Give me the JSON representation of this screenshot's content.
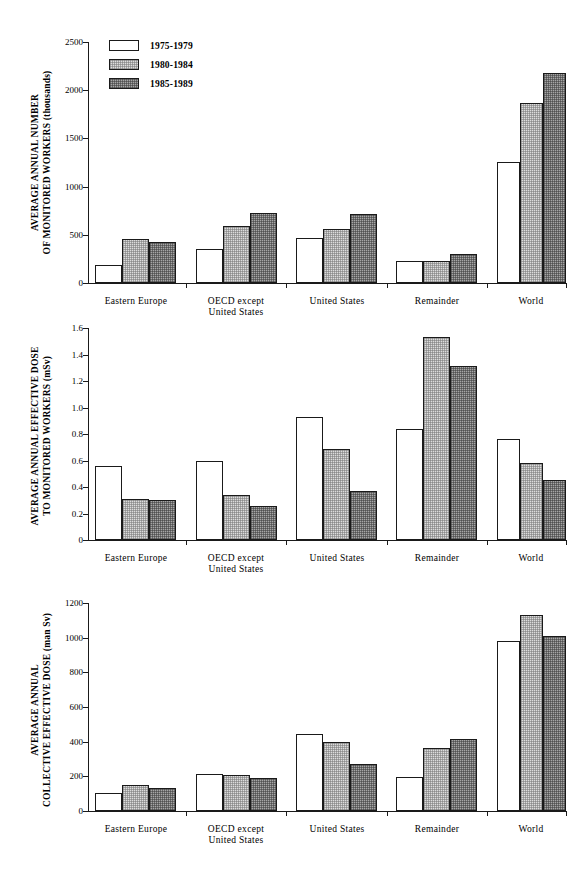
{
  "legend": {
    "position": "top-left-inside-first-panel",
    "entries": [
      {
        "label": "1975-1979",
        "fill": "#ffffff"
      },
      {
        "label": "1980-1984",
        "fill": "#dcdcdc"
      },
      {
        "label": "1985-1989",
        "fill": "#a6a6a6"
      }
    ]
  },
  "categories": [
    "Eastern  Europe",
    "OECD  except\nUnited  States",
    "United  States",
    "Remainder",
    "World"
  ],
  "chart_data": [
    {
      "type": "bar",
      "title": "",
      "ylabel": "AVERAGE  ANNUAL  NUMBER OF MONITORED WORKERS  (thousands)",
      "ylabel_line1": "AVERAGE  ANNUAL  NUMBER",
      "ylabel_line2": "OF MONITORED WORKERS  (thousands)",
      "xlabel": "",
      "ylim": [
        0,
        2500
      ],
      "yticks": [
        0,
        500,
        1000,
        1500,
        2000,
        2500
      ],
      "ytick_labels": [
        "0",
        "500",
        "1000",
        "1500",
        "2000",
        "2500"
      ],
      "grid": false,
      "legend": "top-left",
      "categories": [
        "Eastern  Europe",
        "OECD  except United  States",
        "United  States",
        "Remainder",
        "World"
      ],
      "series": [
        {
          "name": "1975-1979",
          "values": [
            190,
            355,
            470,
            225,
            1255
          ]
        },
        {
          "name": "1980-1984",
          "values": [
            455,
            595,
            565,
            225,
            1870
          ]
        },
        {
          "name": "1985-1989",
          "values": [
            425,
            725,
            720,
            305,
            2180
          ]
        }
      ]
    },
    {
      "type": "bar",
      "title": "",
      "ylabel": "AVERAGE  ANNUAL  EFFECTIVE DOSE TO MONITORED WORKERS  (mSv)",
      "ylabel_line1": "AVERAGE  ANNUAL  EFFECTIVE DOSE",
      "ylabel_line2": "TO MONITORED WORKERS  (mSv)",
      "xlabel": "",
      "ylim": [
        0,
        1.6
      ],
      "yticks": [
        0,
        0.2,
        0.4,
        0.6,
        0.8,
        1.0,
        1.2,
        1.4,
        1.6
      ],
      "ytick_labels": [
        "0",
        "0.2",
        "0.4",
        "0.6",
        "0.8",
        "1.0",
        "1.2",
        "1.4",
        "1.6"
      ],
      "grid": false,
      "legend": "none",
      "categories": [
        "Eastern  Europe",
        "OECD  except United  States",
        "United  States",
        "Remainder",
        "World"
      ],
      "series": [
        {
          "name": "1975-1979",
          "values": [
            0.56,
            0.6,
            0.93,
            0.84,
            0.76
          ]
        },
        {
          "name": "1980-1984",
          "values": [
            0.31,
            0.34,
            0.69,
            1.53,
            0.58
          ]
        },
        {
          "name": "1985-1989",
          "values": [
            0.3,
            0.26,
            0.37,
            1.31,
            0.45
          ]
        }
      ]
    },
    {
      "type": "bar",
      "title": "",
      "ylabel": "AVERAGE  ANNUAL COLLECTIVE EFFECTIVE DOSE  (man Sv)",
      "ylabel_line1": "AVERAGE  ANNUAL",
      "ylabel_line2": "COLLECTIVE EFFECTIVE DOSE  (man Sv)",
      "xlabel": "",
      "ylim": [
        0,
        1200
      ],
      "yticks": [
        0,
        200,
        400,
        600,
        800,
        1000,
        1200
      ],
      "ytick_labels": [
        "0",
        "200",
        "400",
        "600",
        "800",
        "1000",
        "1200"
      ],
      "grid": false,
      "legend": "none",
      "categories": [
        "Eastern  Europe",
        "OECD  except United  States",
        "United  States",
        "Remainder",
        "World"
      ],
      "series": [
        {
          "name": "1975-1979",
          "values": [
            105,
            215,
            445,
            195,
            980
          ]
        },
        {
          "name": "1980-1984",
          "values": [
            150,
            205,
            400,
            365,
            1130
          ]
        },
        {
          "name": "1985-1989",
          "values": [
            130,
            190,
            270,
            415,
            1010
          ]
        }
      ]
    }
  ]
}
